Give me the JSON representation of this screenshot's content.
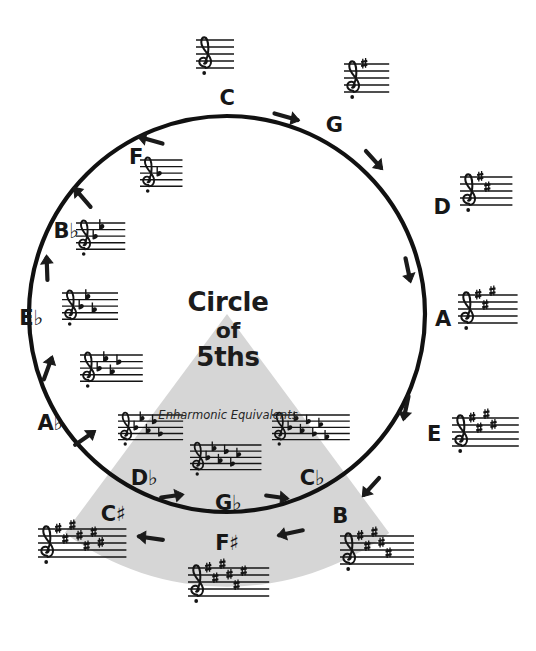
{
  "figure": {
    "title_line1": "Circle",
    "title_line2": "of",
    "title_line3": "5ths",
    "enharmonic_caption": "Enharmonic Equivalents",
    "wedge_color": "#d6d6d6",
    "line_color": "#111111",
    "background": "#ffffff"
  },
  "circle": {
    "center_x": 227,
    "center_y": 314,
    "radius": 198,
    "stroke_width": 4
  },
  "chart_data": {
    "type": "diagram",
    "title": "Circle of 5ths",
    "clockwise_direction": "sharps",
    "counterclockwise_direction": "flats",
    "keys_outer_top": [
      {
        "name": "C",
        "accidental": "",
        "angle_deg": 0,
        "sharps": 0,
        "flats": 0,
        "signature": "no sharps or flats"
      },
      {
        "name": "G",
        "accidental": "",
        "angle_deg": 30,
        "sharps": 1,
        "flats": 0,
        "signature": "1 sharp"
      },
      {
        "name": "D",
        "accidental": "",
        "angle_deg": 60,
        "sharps": 2,
        "flats": 0,
        "signature": "2 sharps"
      },
      {
        "name": "A",
        "accidental": "",
        "angle_deg": 90,
        "sharps": 3,
        "flats": 0,
        "signature": "3 sharps"
      },
      {
        "name": "E",
        "accidental": "",
        "angle_deg": 120,
        "sharps": 4,
        "flats": 0,
        "signature": "4 sharps"
      },
      {
        "name": "B",
        "accidental": "",
        "angle_deg": 150,
        "sharps": 5,
        "flats": 0,
        "signature": "5 sharps"
      },
      {
        "name": "F",
        "accidental": "♯",
        "angle_deg": 180,
        "sharps": 6,
        "flats": 0,
        "signature": "6 sharps"
      },
      {
        "name": "C",
        "accidental": "♯",
        "angle_deg": 210,
        "sharps": 7,
        "flats": 0,
        "signature": "7 sharps"
      },
      {
        "name": "A",
        "accidental": "♭",
        "angle_deg": 240,
        "sharps": 0,
        "flats": 4,
        "signature": "4 flats"
      },
      {
        "name": "E",
        "accidental": "♭",
        "angle_deg": 270,
        "sharps": 0,
        "flats": 3,
        "signature": "3 flats"
      },
      {
        "name": "B",
        "accidental": "♭",
        "angle_deg": 300,
        "sharps": 0,
        "flats": 2,
        "signature": "2 flats"
      },
      {
        "name": "F",
        "accidental": "",
        "angle_deg": 330,
        "sharps": 0,
        "flats": 1,
        "signature": "1 flat"
      }
    ],
    "enharmonic_keys_inner": [
      {
        "name": "D",
        "accidental": "♭",
        "flats": 5,
        "signature": "5 flats",
        "equals": "C♯"
      },
      {
        "name": "G",
        "accidental": "♭",
        "flats": 6,
        "signature": "6 flats",
        "equals": "F♯"
      },
      {
        "name": "C",
        "accidental": "♭",
        "flats": 7,
        "signature": "7 flats",
        "equals": "B"
      }
    ]
  },
  "labels": {
    "c": {
      "text": "C",
      "acc": ""
    },
    "g": {
      "text": "G",
      "acc": ""
    },
    "d": {
      "text": "D",
      "acc": ""
    },
    "a": {
      "text": "A",
      "acc": ""
    },
    "e": {
      "text": "E",
      "acc": ""
    },
    "b": {
      "text": "B",
      "acc": ""
    },
    "fsharp": {
      "text": "F",
      "acc": "♯"
    },
    "csharp": {
      "text": "C",
      "acc": "♯"
    },
    "aflat": {
      "text": "A",
      "acc": "♭"
    },
    "eflat": {
      "text": "E",
      "acc": "♭"
    },
    "bflat": {
      "text": "B",
      "acc": "♭"
    },
    "f": {
      "text": "F",
      "acc": ""
    },
    "dflat": {
      "text": "D",
      "acc": "♭"
    },
    "gflat": {
      "text": "G",
      "acc": "♭"
    },
    "cflat": {
      "text": "C",
      "acc": "♭"
    }
  }
}
